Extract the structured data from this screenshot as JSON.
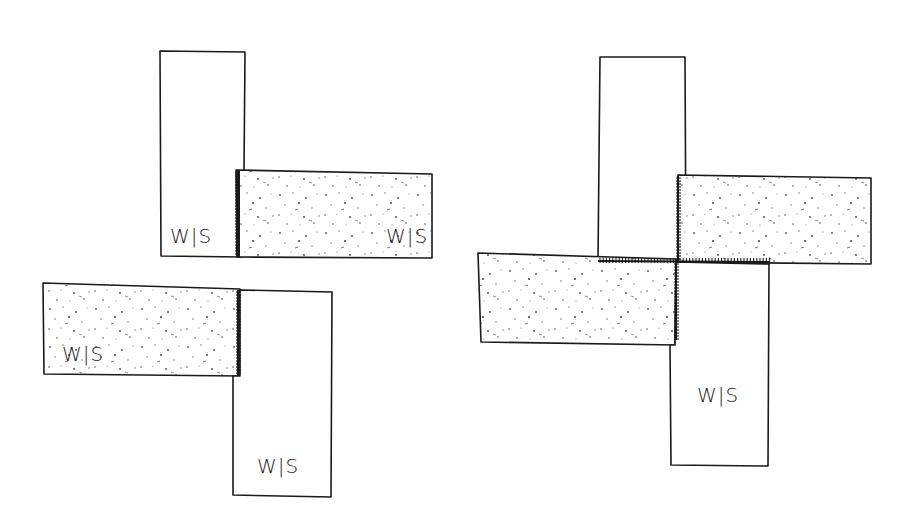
{
  "diagram": {
    "label_text": "W|S",
    "legend": {
      "plain_fill": "wrong side up (white)",
      "speckled_fill": "right side / patterned fabric"
    },
    "colors": {
      "line": "#1a1a1a",
      "background": "#ffffff",
      "speckle": "#555555"
    },
    "figures": [
      {
        "id": "left-figure",
        "pieces": [
          {
            "id": "piece-a",
            "fill": "plain",
            "orientation": "vertical",
            "label": "W|S"
          },
          {
            "id": "piece-b",
            "fill": "speckled",
            "orientation": "horizontal",
            "label": "W|S"
          },
          {
            "id": "piece-c",
            "fill": "speckled",
            "orientation": "horizontal",
            "label": "W|S"
          },
          {
            "id": "piece-d",
            "fill": "plain",
            "orientation": "vertical",
            "label": "W|S"
          }
        ],
        "seams": [
          "vertical seam between piece-a and piece-b",
          "vertical seam between piece-c and piece-d"
        ]
      },
      {
        "id": "right-figure",
        "pieces": [
          {
            "id": "piece-e",
            "fill": "plain",
            "orientation": "vertical",
            "label": ""
          },
          {
            "id": "piece-f",
            "fill": "speckled",
            "orientation": "horizontal",
            "label": ""
          },
          {
            "id": "piece-g",
            "fill": "speckled",
            "orientation": "horizontal",
            "label": ""
          },
          {
            "id": "piece-h",
            "fill": "plain",
            "orientation": "vertical",
            "label": "W|S"
          }
        ],
        "seams": [
          "horizontal center seam",
          "vertical center seam"
        ]
      }
    ]
  }
}
